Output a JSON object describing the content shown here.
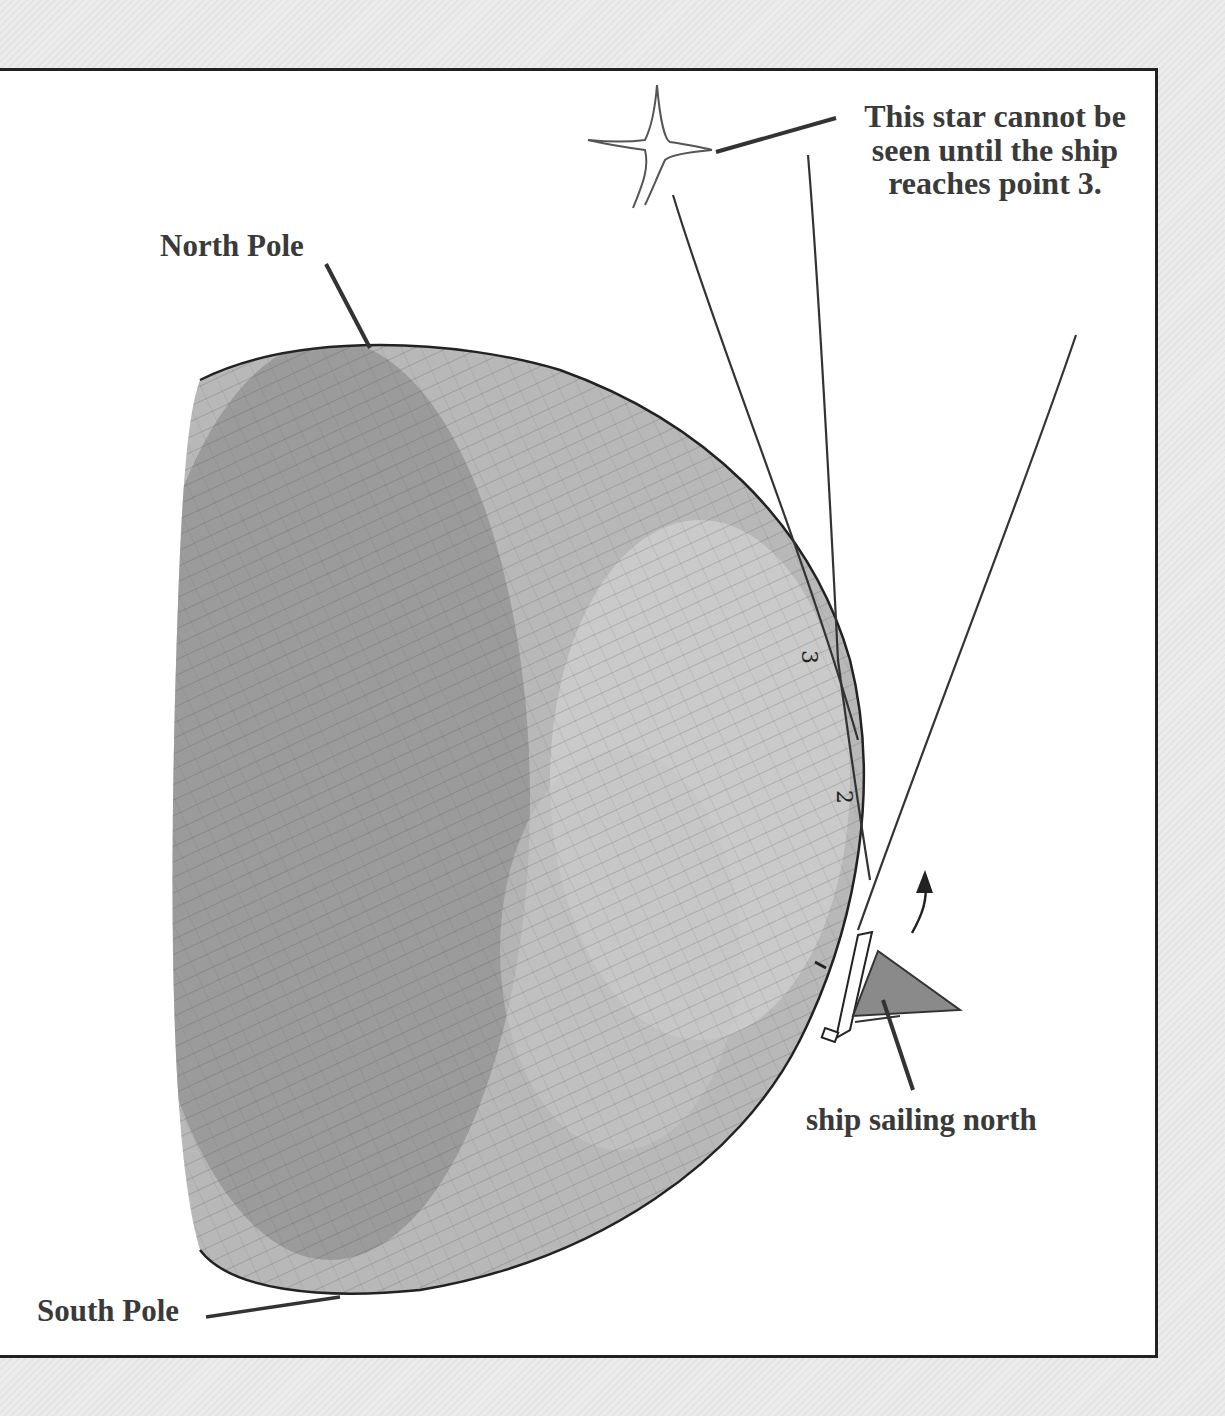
{
  "diagram": {
    "labels": {
      "star_note_lines": [
        "This star cannot be",
        "seen until the ship",
        "reaches point 3."
      ],
      "north_pole": "North Pole",
      "south_pole": "South Pole",
      "ship": "ship sailing north"
    },
    "points": [
      "1",
      "2",
      "3"
    ],
    "icons": [
      "star-icon",
      "ship-icon",
      "arrow-up-icon",
      "globe-illustration"
    ],
    "colors": {
      "background": "#e9e9e9",
      "panel": "#ffffff",
      "border": "#222222",
      "text": "#3a3a3a",
      "globe_shade": "#9a9a9a",
      "ship_sail": "#888888"
    }
  }
}
